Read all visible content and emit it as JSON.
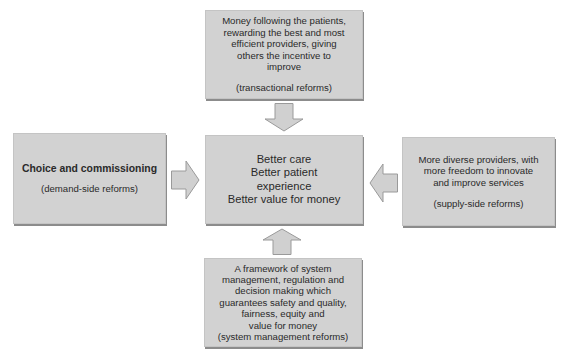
{
  "diagram": {
    "type": "reform-framework",
    "colors": {
      "box_fill": "#d2d2d2",
      "box_shadow": "#8c8c8c",
      "arrow_fill": "#d0d0d0",
      "arrow_stroke": "#9a9a9a",
      "text": "#2a2a2a",
      "background": "#ffffff"
    },
    "top_box": {
      "lines": [
        "Money following the patients,",
        "rewarding the best and most",
        "efficient providers, giving",
        "others the incentive to",
        "improve"
      ],
      "label": "(transactional reforms)"
    },
    "left_box": {
      "title": "Choice and commissioning",
      "label": "(demand-side reforms)"
    },
    "center_box": {
      "lines": [
        "Better care",
        "Better patient",
        "experience",
        "Better value for money"
      ]
    },
    "right_box": {
      "lines": [
        "More diverse providers, with",
        "more freedom to innovate",
        "and improve services"
      ],
      "label": "(supply-side reforms)"
    },
    "bottom_box": {
      "lines": [
        "A framework of system",
        "management, regulation and",
        "decision making which",
        "guarantees safety and quality,",
        "fairness, equity and",
        "value for money"
      ],
      "label": "(system management reforms)"
    },
    "arrows": [
      {
        "from": "top_box",
        "to": "center_box",
        "direction": "down"
      },
      {
        "from": "left_box",
        "to": "center_box",
        "direction": "right"
      },
      {
        "from": "right_box",
        "to": "center_box",
        "direction": "left"
      },
      {
        "from": "bottom_box",
        "to": "center_box",
        "direction": "up"
      }
    ]
  }
}
